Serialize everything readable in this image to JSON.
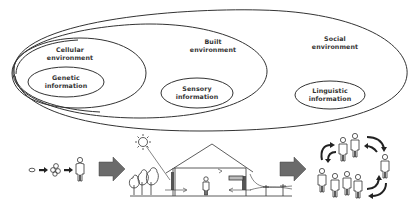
{
  "diagram": {
    "type": "nested-environment-diagram",
    "environments": [
      {
        "id": "social",
        "line1": "Social",
        "line2": "environment"
      },
      {
        "id": "built",
        "line1": "Built",
        "line2": "environment"
      },
      {
        "id": "cellular",
        "line1": "Cellular",
        "line2": "environment"
      }
    ],
    "information": [
      {
        "id": "genetic",
        "line1": "Genetic",
        "line2": "information"
      },
      {
        "id": "sensory",
        "line1": "Sensory",
        "line2": "information"
      },
      {
        "id": "linguistic",
        "line1": "Linguistic",
        "line2": "information"
      }
    ],
    "bottom_panels": [
      {
        "id": "development",
        "description": "cell to cluster to human figure progression"
      },
      {
        "id": "built-house",
        "description": "house cross-section with sun, trees, person, utility poles"
      },
      {
        "id": "social-group",
        "description": "group of people with circulating arrows"
      }
    ],
    "colors": {
      "line": "#333333",
      "arrow_fill": "#6b6b6b",
      "background": "#ffffff"
    }
  }
}
